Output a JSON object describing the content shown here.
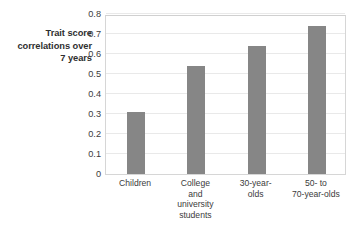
{
  "chart_data": {
    "type": "bar",
    "title": "",
    "subtitle": "",
    "xlabel": "",
    "ylabel": "Trait score correlations over 7 years",
    "ylabel_lines": [
      "Trait score",
      "correlations over",
      "7 years"
    ],
    "categories": [
      "Children",
      "College and university students",
      "30-year-olds",
      "50- to 70-year-olds"
    ],
    "category_lines": [
      [
        "Children"
      ],
      [
        "College",
        "and",
        "university",
        "students"
      ],
      [
        "30-year-",
        "olds"
      ],
      [
        "50- to",
        "70-year-olds"
      ]
    ],
    "values": [
      0.31,
      0.54,
      0.64,
      0.74
    ],
    "ylim": [
      0,
      0.8
    ],
    "ytick_labels": [
      "0.8",
      "0.7",
      "0.6",
      "0.5",
      "0.4",
      "0.3",
      "0.2",
      "0.1",
      "0"
    ],
    "ytick_values": [
      0.8,
      0.7,
      0.6,
      0.5,
      0.4,
      0.3,
      0.2,
      0.1,
      0
    ],
    "grid": true,
    "grid_orientation": "horizontal",
    "legend": false,
    "legend_position": "none",
    "bar_color": "#868686",
    "grid_color": "#e9e9e9",
    "plot_border_color": "#d6d6d6",
    "background_color": "#ffffff",
    "text_color": "#3b3b3b"
  }
}
